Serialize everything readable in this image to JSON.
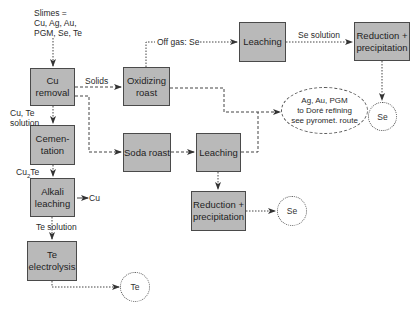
{
  "diagram": {
    "feed": {
      "lines": [
        "Slimes =",
        "Cu, Ag, Au,",
        "PGM, Se, Te"
      ]
    },
    "nodes": {
      "cu_removal": {
        "lines": [
          "Cu",
          "removal"
        ]
      },
      "cementation": {
        "lines": [
          "Cemen-",
          "tation"
        ]
      },
      "alkali_leaching": {
        "lines": [
          "Alkali",
          "leaching"
        ]
      },
      "te_electrolysis": {
        "lines": [
          "Te",
          "electrolysis"
        ]
      },
      "oxidizing_roast": {
        "lines": [
          "Oxidizing",
          "roast"
        ]
      },
      "leaching_top": {
        "lines": [
          "Leaching"
        ]
      },
      "reduction_top": {
        "lines": [
          "Reduction +",
          "precipitation"
        ]
      },
      "soda_roast": {
        "lines": [
          "Soda roast"
        ]
      },
      "leaching_mid": {
        "lines": [
          "Leaching"
        ]
      },
      "reduction_mid": {
        "lines": [
          "Reduction +",
          "precipitation"
        ]
      }
    },
    "products": {
      "te": "Te",
      "se_top": "Se",
      "se_mid": "Se",
      "precious": [
        "Ag, Au, PGM",
        "to Doré refining",
        "see pyromet. route"
      ]
    },
    "edge_labels": {
      "solids": "Solids",
      "off_gas": "Off gas: Se",
      "se_solution": "Se solution",
      "cu_te_solution": [
        "Cu, Te",
        "solution"
      ],
      "cu2te": "Cu",
      "cu2te_sub": "2",
      "cu2te_suffix": "Te",
      "cu_out": "Cu",
      "te_solution": "Te solution"
    },
    "colors": {
      "box_fill": "#b9b9b9",
      "box_border": "#4a4a4a",
      "line": "#444444",
      "background": "#ffffff"
    }
  }
}
